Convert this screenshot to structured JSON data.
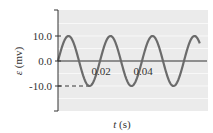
{
  "chart_data": {
    "type": "line",
    "title": "",
    "xlabel": "t (s)",
    "ylabel": "ε (mv)",
    "ylim": [
      -20,
      20
    ],
    "xlim": [
      0,
      0.0705
    ],
    "yticks": [
      10.0,
      0.0,
      -10.0
    ],
    "ytick_labels": [
      "10.0",
      "0.0",
      "-10.0"
    ],
    "xtick_labels": [
      "0.02",
      "0.04"
    ],
    "xticks": [
      0.02,
      0.04
    ],
    "grid": true,
    "legend": null,
    "series": [
      {
        "name": "emf",
        "function": "10 sin(2π t / 0.02)",
        "amplitude": 10.0,
        "period": 0.02,
        "x": [
          0,
          0.005,
          0.01,
          0.015,
          0.02,
          0.025,
          0.03,
          0.035,
          0.04,
          0.045,
          0.05,
          0.055,
          0.06,
          0.065,
          0.0675
        ],
        "values": [
          0,
          10,
          0,
          -10,
          0,
          10,
          0,
          -10,
          0,
          10,
          0,
          -10,
          0,
          10,
          7.1
        ]
      }
    ],
    "annotations": [
      {
        "type": "dashed-line",
        "from": "y-axis",
        "at_y": -10.0,
        "to_t": 0.015
      }
    ]
  },
  "colors": {
    "plot_bg": "#ebebeb",
    "grid": "#f8f8f8",
    "curve": "#6b6b6b",
    "axis": "#333333"
  }
}
